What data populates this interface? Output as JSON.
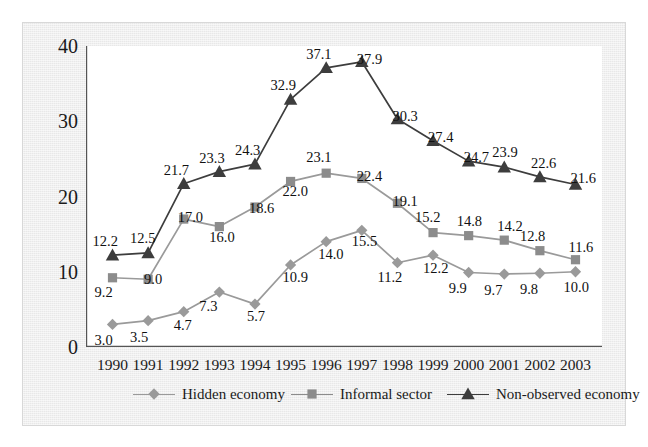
{
  "chart_data": {
    "type": "line",
    "title": "",
    "subtitle": "",
    "xlabel": "",
    "ylabel": "",
    "xlim": [
      1989.5,
      2003.5
    ],
    "ylim": [
      0,
      40
    ],
    "yticks": [
      0,
      10,
      20,
      30,
      40
    ],
    "grid": false,
    "legend_position": "bottom",
    "categories": [
      1990,
      1991,
      1992,
      1993,
      1994,
      1995,
      1996,
      1997,
      1998,
      1999,
      2000,
      2001,
      2002,
      2003
    ],
    "x_tick_labels": [
      "1990",
      "1991",
      "1992",
      "1993",
      "1994",
      "1995",
      "1996",
      "1997",
      "1998",
      "1999",
      "2000",
      "2001",
      "2002",
      "2003"
    ],
    "y_tick_labels": [
      "0",
      "10",
      "20",
      "30",
      "40"
    ],
    "series": [
      {
        "name": "Hidden economy",
        "marker": "diamond",
        "color": "#9a9a9a",
        "line_color": "#9a9a9a",
        "values": [
          3.0,
          3.5,
          4.7,
          7.3,
          5.7,
          10.9,
          14.0,
          15.5,
          11.2,
          12.2,
          9.9,
          9.7,
          9.8,
          10.0
        ],
        "labels": [
          "3.0",
          "3.5",
          "4.7",
          "7.3",
          "5.7",
          "10.9",
          "14.0",
          "15.5",
          "11.2",
          "12.2",
          "9.9",
          "9.7",
          "9.8",
          "10.0"
        ]
      },
      {
        "name": "Informal sector",
        "marker": "square",
        "color": "#8c8c8c",
        "line_color": "#9a9a9a",
        "values": [
          9.2,
          9.0,
          17.0,
          16.0,
          18.6,
          22.0,
          23.1,
          22.4,
          19.1,
          15.2,
          14.8,
          14.2,
          12.8,
          11.6
        ],
        "labels": [
          "9.2",
          "9.0",
          "17.0",
          "16.0",
          "18.6",
          "22.0",
          "23.1",
          "22.4",
          "19.1",
          "15.2",
          "14.8",
          "14.2",
          "12.8",
          "11.6"
        ]
      },
      {
        "name": "Non-observed economy",
        "marker": "triangle",
        "color": "#3d3d3d",
        "line_color": "#3d3d3d",
        "values": [
          12.2,
          12.5,
          21.7,
          23.3,
          24.3,
          32.9,
          37.1,
          37.9,
          30.3,
          27.4,
          24.7,
          23.9,
          22.6,
          21.6
        ],
        "labels": [
          "12.2",
          "12.5",
          "21.7",
          "23.3",
          "24.3",
          "32.9",
          "37.1",
          "37.9",
          "30.3",
          "27.4",
          "24.7",
          "23.9",
          "22.6",
          "21.6"
        ]
      }
    ]
  },
  "legend": {
    "items": [
      {
        "label": "Hidden economy",
        "marker": "diamond-marker-icon",
        "color": "#9a9a9a"
      },
      {
        "label": "Informal sector",
        "marker": "square-marker-icon",
        "color": "#8c8c8c"
      },
      {
        "label": "Non-observed economy",
        "marker": "triangle-marker-icon",
        "color": "#3d3d3d"
      }
    ]
  },
  "label_offsets": {
    "hidden_economy": [
      [
        -4,
        16
      ],
      [
        -4,
        16
      ],
      [
        4,
        13
      ],
      [
        -6,
        14
      ],
      [
        6,
        12
      ],
      [
        6,
        12
      ],
      [
        6,
        12
      ],
      [
        4,
        11
      ],
      [
        -6,
        14
      ],
      [
        4,
        13
      ],
      [
        -6,
        15
      ],
      [
        -6,
        16
      ],
      [
        -6,
        16
      ],
      [
        2,
        15
      ]
    ],
    "informal_sector": [
      [
        -4,
        14
      ],
      [
        10,
        0
      ],
      [
        8,
        -2
      ],
      [
        4,
        10
      ],
      [
        8,
        1
      ],
      [
        6,
        10
      ],
      [
        -6,
        -16
      ],
      [
        9,
        -2
      ],
      [
        9,
        -2
      ],
      [
        -4,
        -16
      ],
      [
        2,
        -15
      ],
      [
        7,
        -14
      ],
      [
        -6,
        -15
      ],
      [
        7,
        -13
      ]
    ],
    "non_observed_economy": [
      [
        -6,
        -14
      ],
      [
        -4,
        -15
      ],
      [
        -6,
        -14
      ],
      [
        -6,
        -14
      ],
      [
        -6,
        -14
      ],
      [
        -6,
        -14
      ],
      [
        -6,
        -14
      ],
      [
        9,
        -3
      ],
      [
        9,
        -3
      ],
      [
        9,
        -4
      ],
      [
        9,
        -4
      ],
      [
        2,
        -15
      ],
      [
        5,
        -14
      ],
      [
        9,
        -6
      ]
    ]
  }
}
